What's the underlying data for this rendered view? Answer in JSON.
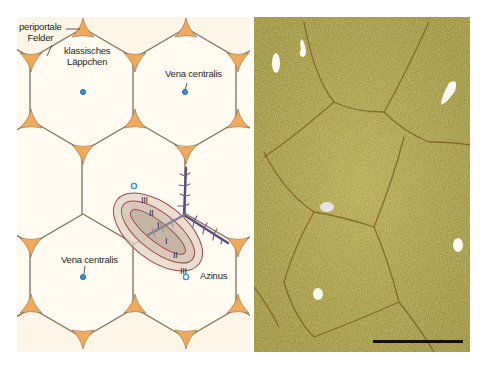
{
  "diagram": {
    "labels": {
      "periportal_fields_line1": "periportale",
      "periportal_fields_line2": "Felder",
      "classic_lobule_line1": "klassisches",
      "classic_lobule_line2": "Läppchen",
      "central_vein_top": "Vena centralis",
      "central_vein_bottom": "Vena centralis",
      "acinus": "Azinus",
      "zones": [
        "III",
        "II",
        "I",
        "I",
        "II",
        "III"
      ]
    },
    "colors": {
      "background": "#fdf6e6",
      "hex_outline": "#8a7a62",
      "portal_field": "#f3a95a",
      "central_vein": "#3a8fd1",
      "acinus_outline": "#a2464a",
      "acinus_fill": "#c8b8a8",
      "vessel": "#5a4a7a",
      "micrograph": "#a59a3e"
    }
  },
  "micrograph": {
    "description": "Histologisches Präparat Leber",
    "scale_bar": "scale bar"
  }
}
